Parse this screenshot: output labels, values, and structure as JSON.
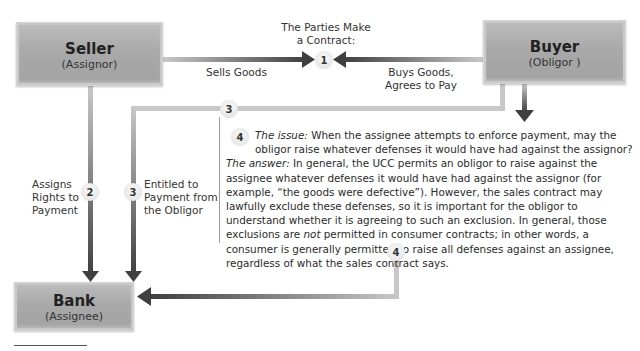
{
  "nodes": {
    "seller": {
      "title": "Seller",
      "subtitle": "(Assignor)"
    },
    "buyer": {
      "title": "Buyer",
      "subtitle": "(Obligor )"
    },
    "bank": {
      "title": "Bank",
      "subtitle": "(Assignee)"
    }
  },
  "step1": {
    "heading_line1": "The Parties Make",
    "heading_line2": "a Contract:",
    "number": "1",
    "left_label": "Sells Goods",
    "right_label_line1": "Buys Goods,",
    "right_label_line2": "Agrees to Pay"
  },
  "step2": {
    "number": "2",
    "label_line1": "Assigns",
    "label_line2": "Rights to",
    "label_line3": "Payment"
  },
  "step3": {
    "number": "3",
    "label_line1": "Entitled to",
    "label_line2": "Payment from",
    "label_line3": "the Obligor"
  },
  "step4": {
    "number": "4",
    "issue_label": "The issue:",
    "issue_text": "When the assignee attempts to enforce payment, may the obligor raise whatever defenses it would have had against the assignor?",
    "answer_label": "The answer:",
    "answer_text_1": "In general, the UCC permits an obligor to raise against the assignee whatever defenses it would have had against the assignor (for example, “the goods were defective”). However, the sales contract may lawfully exclude these defenses, so it is important for the obligor to understand whether it is agreeing to such an exclusion. In general, those exclusions are ",
    "answer_emphasis": "not",
    "answer_text_2": " permitted in consumer contracts; in other words, a consumer is generally permitted to raise all defenses against an assignee, regardless of what the sales contract says."
  },
  "colors": {
    "box_fill": "#a9a9a9",
    "connector_light": "#c8c8c8",
    "arrow_dark": "#4a4a4a",
    "badge_fill": "#e8e8e8",
    "text": "#2b2b2b"
  }
}
